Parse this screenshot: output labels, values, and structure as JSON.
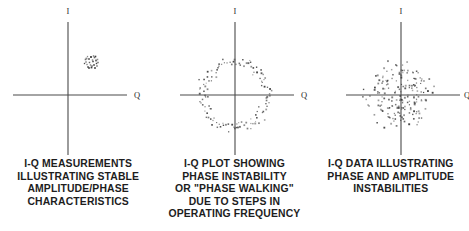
{
  "figure": {
    "background_color": "#ffffff",
    "axis_color": "#4a4a4a",
    "dot_color": "#3a3a3a",
    "text_color": "#1d1d1d"
  },
  "panels": [
    {
      "id": "panel-stable",
      "axis_labels": {
        "vertical": "I",
        "horizontal": "Q"
      },
      "caption_lines": [
        "I-Q MEASUREMENTS",
        "ILLUSTRATING STABLE",
        "AMPLITUDE/PHASE",
        "CHARACTERISTICS"
      ],
      "caption_text": "I-Q MEASUREMENTS ILLUSTRATING STABLE AMPLITUDE/PHASE CHARACTERISTICS"
    },
    {
      "id": "panel-phase-walking",
      "axis_labels": {
        "vertical": "I",
        "horizontal": "Q"
      },
      "caption_lines": [
        "I-Q PLOT SHOWING",
        "PHASE INSTABILITY",
        "OR \"PHASE WALKING\"",
        "DUE TO STEPS IN",
        "OPERATING FREQUENCY"
      ],
      "caption_text": "I-Q PLOT SHOWING PHASE INSTABILITY OR \"PHASE WALKING\" DUE TO STEPS IN OPERATING FREQUENCY"
    },
    {
      "id": "panel-phase-amplitude",
      "axis_labels": {
        "vertical": "I",
        "horizontal": "Q"
      },
      "caption_lines": [
        "I-Q DATA ILLUSTRATING",
        "PHASE AND AMPLITUDE",
        "INSTABILITIES"
      ],
      "caption_text": "I-Q DATA ILLUSTRATING PHASE AND AMPLITUDE INSTABILITIES"
    }
  ],
  "chart_data": [
    {
      "type": "scatter",
      "title": "I-Q MEASUREMENTS ILLUSTRATING STABLE AMPLITUDE/PHASE CHARACTERISTICS",
      "xlabel": "Q",
      "ylabel": "I",
      "xlim": [
        -55,
        59
      ],
      "ylim": [
        -60,
        73
      ],
      "grid": false,
      "legend": "none",
      "axes": {
        "origin_px": [
          68,
          95
        ],
        "x_axis_px": [
          13,
          127
        ],
        "y_axis_px": [
          22,
          155
        ]
      },
      "cluster": {
        "center": [
          23,
          34
        ],
        "spread": 5.5,
        "n_points": 26
      },
      "points": [
        [
          19.5,
          38.5
        ],
        [
          23.0,
          38.0
        ],
        [
          26.5,
          37.5
        ],
        [
          17.5,
          35.5
        ],
        [
          21.0,
          36.0
        ],
        [
          24.5,
          35.0
        ],
        [
          28.0,
          34.5
        ],
        [
          18.0,
          33.0
        ],
        [
          21.5,
          32.5
        ],
        [
          25.0,
          33.5
        ],
        [
          28.5,
          31.5
        ],
        [
          19.0,
          30.5
        ],
        [
          22.5,
          30.0
        ],
        [
          26.0,
          30.0
        ],
        [
          29.0,
          29.0
        ],
        [
          20.0,
          28.0
        ],
        [
          23.5,
          27.5
        ],
        [
          27.0,
          27.0
        ],
        [
          18.5,
          36.5
        ],
        [
          25.5,
          39.0
        ],
        [
          29.5,
          35.5
        ],
        [
          16.5,
          31.5
        ],
        [
          24.0,
          29.0
        ],
        [
          27.5,
          38.5
        ],
        [
          21.0,
          27.0
        ],
        [
          30.0,
          32.5
        ]
      ]
    },
    {
      "type": "scatter",
      "title": "I-Q PLOT SHOWING PHASE INSTABILITY OR \"PHASE WALKING\" DUE TO STEPS IN OPERATING FREQUENCY",
      "xlabel": "Q",
      "ylabel": "I",
      "xlim": [
        -55,
        59
      ],
      "ylim": [
        -60,
        73
      ],
      "grid": false,
      "legend": "none",
      "axes": {
        "origin_px": [
          235,
          95
        ],
        "x_axis_px": [
          180,
          294
        ],
        "y_axis_px": [
          22,
          155
        ]
      },
      "ring": {
        "center": [
          0,
          0
        ],
        "radius": 33,
        "radial_jitter": 2.6,
        "n_points": 108
      }
    },
    {
      "type": "scatter",
      "title": "I-Q DATA ILLUSTRATING PHASE AND AMPLITUDE INSTABILITIES",
      "xlabel": "Q",
      "ylabel": "I",
      "xlim": [
        -55,
        59
      ],
      "ylim": [
        -60,
        73
      ],
      "grid": false,
      "legend": "none",
      "axes": {
        "origin_px": [
          401,
          95
        ],
        "x_axis_px": [
          346,
          460
        ],
        "y_axis_px": [
          22,
          155
        ]
      },
      "blob": {
        "center": [
          -2,
          0
        ],
        "radius_x": 38,
        "radius_y": 36,
        "n_points": 185
      }
    }
  ]
}
